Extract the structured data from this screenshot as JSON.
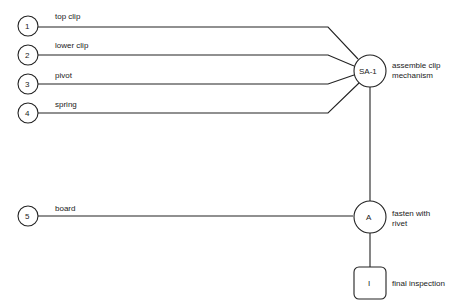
{
  "diagram": {
    "type": "assembly-process-chart",
    "components": [
      {
        "number": "1",
        "label": "top clip"
      },
      {
        "number": "2",
        "label": "lower clip"
      },
      {
        "number": "3",
        "label": "pivot"
      },
      {
        "number": "4",
        "label": "spring"
      },
      {
        "number": "5",
        "label": "board"
      }
    ],
    "subassembly": {
      "code": "SA-1",
      "description_line1": "assemble clip",
      "description_line2": "mechanism"
    },
    "assembly": {
      "code": "A",
      "description_line1": "fasten with",
      "description_line2": "rivet"
    },
    "inspection": {
      "code": "I",
      "description": "final inspection"
    }
  }
}
